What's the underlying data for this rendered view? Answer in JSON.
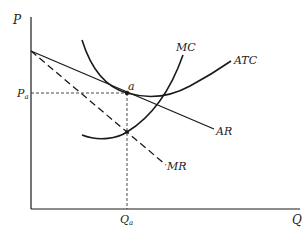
{
  "diagram": {
    "title": "",
    "axes": {
      "y_label": "P",
      "x_label": "Q"
    },
    "curves": [
      {
        "id": "MC",
        "label": "MC",
        "style": "solid"
      },
      {
        "id": "ATC",
        "label": "ATC",
        "style": "solid"
      },
      {
        "id": "AR",
        "label": "AR",
        "style": "solid"
      },
      {
        "id": "MR",
        "label": "MR",
        "style": "dashed"
      }
    ],
    "points": [
      {
        "id": "a",
        "label": "a"
      }
    ],
    "guide_labels": {
      "price": {
        "main": "P",
        "sub": "a"
      },
      "quantity": {
        "main": "Q",
        "sub": "a"
      }
    },
    "colors": {
      "line": "#1a1a1a",
      "background": "#ffffff"
    }
  }
}
